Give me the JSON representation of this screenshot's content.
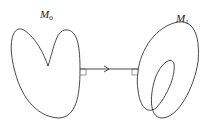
{
  "diagram": {
    "labels": {
      "left": {
        "main": "M",
        "sub": "0"
      },
      "right": {
        "main": "M",
        "sub": "1"
      }
    }
  }
}
